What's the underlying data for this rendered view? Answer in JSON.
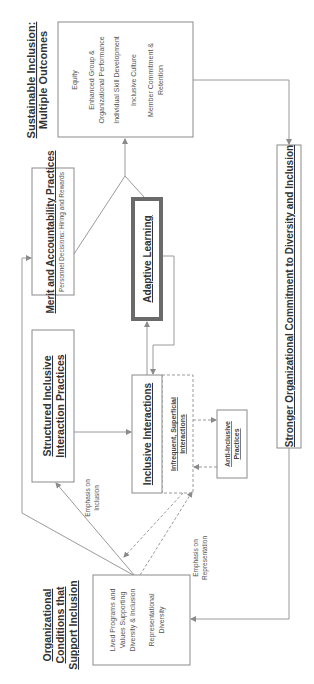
{
  "diagram": {
    "orientation": "rotated-90-ccw",
    "outcomes": {
      "title": "Sustainable Inclusion:",
      "subtitle": "Multiple Outcomes",
      "items": [
        "Equity",
        "Enhanced Group &",
        "Organizational Performance",
        "Individual Skill Development",
        "Inclusive Culture",
        "Member Commitment &",
        "Retention"
      ]
    },
    "merit": {
      "title": "Merit and Accountability Practices",
      "subtitle": "Personnel Decisions: Hiring and Rewards"
    },
    "adaptive": {
      "title": "Adaptive Learning"
    },
    "structured": {
      "title_line1": "Structured Inclusive",
      "title_line2": "Interaction Practices"
    },
    "interactions": {
      "title": "Inclusive Interactions",
      "alt_line1": "Infrequent, Superficial",
      "alt_line2": "Interactions"
    },
    "anti": {
      "line1": "Anti-Inclusive",
      "line2": "Practices"
    },
    "commitment": {
      "title": "Stronger Organizational Commitment to Diversity and Inclusion"
    },
    "conditions": {
      "title_line1": "Organizational",
      "title_line2": "Conditions that",
      "title_line3": "Support Inclusion",
      "item1_line1": "Lived Programs and",
      "item1_line2": "Values Supporting",
      "item1_line3": "Diversity & Inclusion",
      "item2_line1": "Representational",
      "item2_line2": "Diversity"
    },
    "labels": {
      "emphasis_inclusion_1": "Emphasis on",
      "emphasis_inclusion_2": "Inclusion",
      "emphasis_rep_1": "Emphasis on",
      "emphasis_rep_2": "Representation"
    },
    "colors": {
      "line": "#9a9a9a",
      "box_border": "#8a8a8a",
      "thick_border": "#6a6a6a",
      "text": "#333333"
    }
  }
}
